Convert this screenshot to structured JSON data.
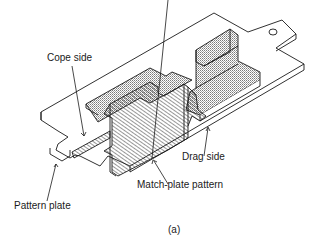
{
  "figure": {
    "caption": "(a)",
    "labels": {
      "cope_side": "Cope side",
      "drag_side": "Drag side",
      "match_plate_pattern": "Match-plate pattern",
      "pattern_plate": "Pattern plate"
    },
    "colors": {
      "line": "#1a1a1a",
      "background": "#ffffff",
      "stipple": "#bdbdbd"
    }
  }
}
